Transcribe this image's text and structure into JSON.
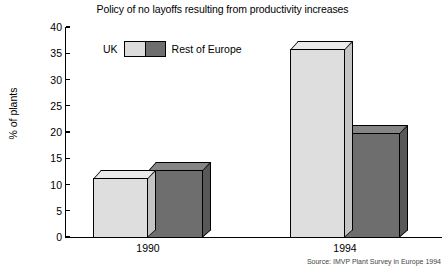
{
  "chart_data": {
    "type": "bar",
    "title": "Policy of no layoffs resulting from productivity increases",
    "xlabel": "",
    "ylabel": "% of plants",
    "categories": [
      "1990",
      "1994"
    ],
    "series": [
      {
        "name": "UK",
        "values": [
          11.5,
          36
        ],
        "color": "#dedede"
      },
      {
        "name": "Rest of Europe",
        "values": [
          13,
          20
        ],
        "color": "#6e6e6e"
      }
    ],
    "ylim": [
      0,
      40
    ],
    "yticks": [
      0,
      5,
      10,
      15,
      20,
      25,
      30,
      35,
      40
    ],
    "ytick_labels": [
      "0",
      "5",
      "10",
      "15",
      "20",
      "25",
      "30",
      "35",
      "40"
    ],
    "grid": false,
    "legend_position": "top-center",
    "three_d": true,
    "source_note": "Source: IMVP Plant Survey in Europe 1994"
  },
  "legend": {
    "uk_label": "UK",
    "rest_label": "Rest of Europe"
  }
}
